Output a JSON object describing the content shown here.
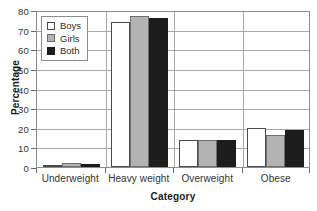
{
  "chart_data": {
    "type": "bar",
    "title": "",
    "xlabel": "Category",
    "ylabel": "Percentage",
    "categories": [
      "Underweight",
      "Heavy weight",
      "Overweight",
      "Obese"
    ],
    "series": [
      {
        "name": "Boys",
        "color": "#ffffff",
        "values": [
          1,
          74,
          14,
          20
        ]
      },
      {
        "name": "Girls",
        "color": "#b3b3b3",
        "values": [
          2,
          77,
          14,
          16.5
        ]
      },
      {
        "name": "Both",
        "color": "#1c1c1c",
        "values": [
          1.5,
          76,
          14,
          19
        ]
      }
    ],
    "ylim": [
      0,
      80
    ],
    "yticks": [
      0,
      10,
      20,
      30,
      40,
      50,
      60,
      70,
      80
    ],
    "ytick_labels": [
      "0",
      "10",
      "20",
      "30",
      "40",
      "50",
      "60",
      "70",
      "80"
    ],
    "grid": true,
    "legend_position": "top-left"
  }
}
